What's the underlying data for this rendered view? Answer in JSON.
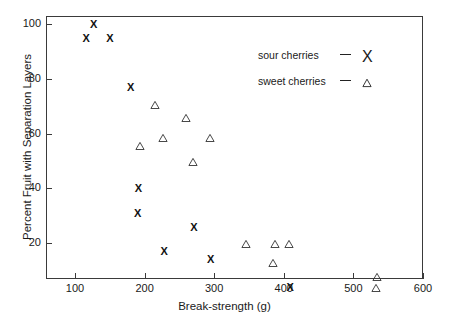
{
  "chart_data": {
    "type": "scatter",
    "title": "",
    "xlabel": "Break-strength (g)",
    "ylabel": "Percent Fruit with Separation Layers",
    "xlim": [
      50,
      600
    ],
    "ylim": [
      0,
      105
    ],
    "xticks": [
      100,
      200,
      300,
      400,
      500,
      600
    ],
    "yticks": [
      20,
      40,
      60,
      80,
      100
    ],
    "grid": false,
    "legend_position": "top-right",
    "series": [
      {
        "name": "sour cherries",
        "marker": "x-glyph",
        "points": [
          {
            "x": 116,
            "y": 95
          },
          {
            "x": 127,
            "y": 100
          },
          {
            "x": 150,
            "y": 95
          },
          {
            "x": 180,
            "y": 77
          },
          {
            "x": 191,
            "y": 40
          },
          {
            "x": 190,
            "y": 31
          },
          {
            "x": 228,
            "y": 17
          },
          {
            "x": 271,
            "y": 26
          },
          {
            "x": 295,
            "y": 14
          },
          {
            "x": 409,
            "y": 4
          }
        ]
      },
      {
        "name": "sweet cherries",
        "marker": "triangle-outline",
        "points": [
          {
            "x": 193,
            "y": 57
          },
          {
            "x": 215,
            "y": 72
          },
          {
            "x": 226,
            "y": 60
          },
          {
            "x": 259,
            "y": 67
          },
          {
            "x": 270,
            "y": 51
          },
          {
            "x": 294,
            "y": 60
          },
          {
            "x": 345,
            "y": 21
          },
          {
            "x": 384,
            "y": 14
          },
          {
            "x": 387,
            "y": 21
          },
          {
            "x": 408,
            "y": 21
          },
          {
            "x": 533,
            "y": 5
          },
          {
            "x": 534,
            "y": 9
          }
        ]
      }
    ]
  },
  "legend": {
    "entries": [
      {
        "label": "sour cherries",
        "dash": "—",
        "marker": "X"
      },
      {
        "label": "sweet cherries",
        "dash": "—",
        "marker": "△"
      }
    ]
  },
  "axis": {
    "x_tick_labels": [
      "100",
      "200",
      "300",
      "400",
      "500",
      "600"
    ],
    "y_tick_labels": [
      "20",
      "40",
      "60",
      "80",
      "100"
    ]
  }
}
